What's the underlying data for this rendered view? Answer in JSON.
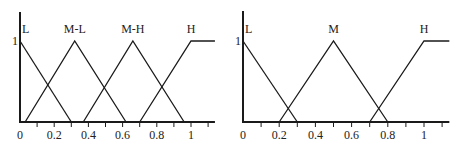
{
  "chart_data": [
    {
      "type": "line",
      "title": "",
      "xlabel": "",
      "ylabel": "",
      "xlim": [
        0,
        1.14
      ],
      "ylim": [
        0,
        1
      ],
      "grid": false,
      "legend": "labels above peaks",
      "x_ticks": [
        "0",
        "0.2",
        "0.4",
        "0.6",
        "0.8",
        "1"
      ],
      "y_ticks": [
        "1"
      ],
      "series": [
        {
          "name": "L",
          "x": [
            0,
            0.3
          ],
          "values": [
            1,
            0
          ]
        },
        {
          "name": "M-L",
          "x": [
            0.03,
            0.32,
            0.62
          ],
          "values": [
            0,
            1,
            0
          ]
        },
        {
          "name": "M-H",
          "x": [
            0.37,
            0.66,
            0.96
          ],
          "values": [
            0,
            1,
            0
          ]
        },
        {
          "name": "H",
          "x": [
            0.7,
            1.0,
            1.14
          ],
          "values": [
            0,
            1,
            1
          ]
        }
      ]
    },
    {
      "type": "line",
      "title": "",
      "xlabel": "",
      "ylabel": "",
      "xlim": [
        0,
        1.14
      ],
      "ylim": [
        0,
        1
      ],
      "grid": false,
      "legend": "labels above peaks",
      "x_ticks": [
        "0",
        "0.2",
        "0.4",
        "0.6",
        "0.8",
        "1"
      ],
      "y_ticks": [
        "1"
      ],
      "series": [
        {
          "name": "L",
          "x": [
            0,
            0.3
          ],
          "values": [
            1,
            0
          ]
        },
        {
          "name": "M",
          "x": [
            0.2,
            0.5,
            0.8
          ],
          "values": [
            0,
            1,
            0
          ]
        },
        {
          "name": "H",
          "x": [
            0.7,
            1.0,
            1.14
          ],
          "values": [
            0,
            1,
            1
          ]
        }
      ]
    }
  ],
  "left": {
    "y_tick_label": "1",
    "x_tick_labels": [
      "0",
      "0.2",
      "0.4",
      "0.6",
      "0.8",
      "1"
    ],
    "set_labels": [
      "L",
      "M-L",
      "M-H",
      "H"
    ]
  },
  "right": {
    "y_tick_label": "1",
    "x_tick_labels": [
      "0",
      "0.2",
      "0.4",
      "0.6",
      "0.8",
      "1"
    ],
    "set_labels": [
      "L",
      "M",
      "H"
    ]
  }
}
